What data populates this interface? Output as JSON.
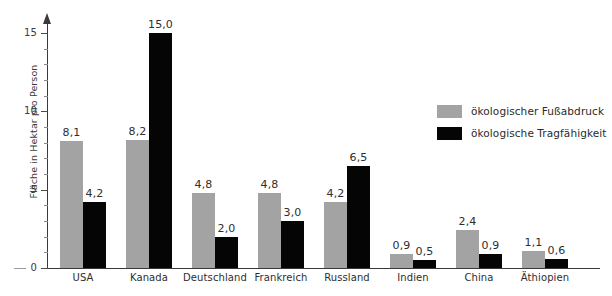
{
  "chart_data": {
    "type": "bar",
    "title": "",
    "subtitle": "",
    "xlabel": "",
    "ylabel": "Fläche in Hektar pro Person",
    "ylim": [
      0,
      16
    ],
    "yticks": [
      0,
      5,
      10,
      15
    ],
    "ytick_labels": [
      "0",
      "5",
      "10",
      "15"
    ],
    "minor_tick_step": 1,
    "grid": false,
    "legend_position": "upper right",
    "categories": [
      "USA",
      "Kanada",
      "Deutschland",
      "Frankreich",
      "Russland",
      "Indien",
      "China",
      "Äthiopien"
    ],
    "series": [
      {
        "name": "ökologischer Fußabdruck",
        "color": "#a3a3a3",
        "values": [
          8.1,
          8.2,
          4.8,
          4.8,
          4.2,
          0.9,
          2.4,
          1.1
        ],
        "labels": [
          "8,1",
          "8,2",
          "4,8",
          "4,8",
          "4,2",
          "0,9",
          "2,4",
          "1,1"
        ]
      },
      {
        "name": "ökologische Tragfähigkeit",
        "color": "#050505",
        "values": [
          4.2,
          15.0,
          2.0,
          3.0,
          6.5,
          0.5,
          0.9,
          0.6
        ],
        "labels": [
          "4,2",
          "15,0",
          "2,0",
          "3,0",
          "6,5",
          "0,5",
          "0,9",
          "0,6"
        ]
      }
    ]
  },
  "legend": {
    "items": [
      {
        "label": "ökologischer Fußabdruck",
        "color": "#a3a3a3"
      },
      {
        "label": "ökologische Tragfähigkeit",
        "color": "#050505"
      }
    ]
  },
  "axis": {
    "y_title": "Fläche in Hektar pro Person",
    "y_tick_labels": [
      "15",
      "10",
      "5",
      "0"
    ]
  }
}
